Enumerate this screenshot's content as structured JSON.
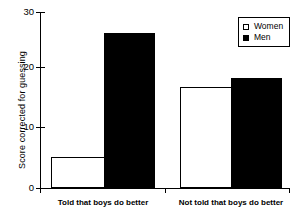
{
  "chart_data": {
    "type": "bar",
    "title": "",
    "xlabel": "",
    "ylabel": "Score corrected for guessing",
    "categories": [
      "Told that boys do better",
      "Not told that boys do better"
    ],
    "series": [
      {
        "name": "Women",
        "values": [
          5.3,
          17.3
        ],
        "color": "#ffffff",
        "edge": "#000000",
        "swatch": "open"
      },
      {
        "name": "Men",
        "values": [
          26.5,
          18.7
        ],
        "color": "#000000",
        "edge": "#000000",
        "swatch": "filled"
      }
    ],
    "ylim": [
      0,
      30
    ],
    "yticks": [
      0,
      10,
      20,
      30
    ],
    "ytick_labels": [
      "0",
      "10",
      "20",
      "30"
    ],
    "grid": false,
    "legend_position": "top-right",
    "legend_entries": [
      "Women",
      "Men"
    ]
  },
  "axis": {
    "y_label": "Score corrected for guessing",
    "tick_0": "0",
    "tick_10": "10",
    "tick_20": "20",
    "tick_30": "30"
  },
  "categories": {
    "group_1": "Told that boys do better",
    "group_2": "Not told that boys do better"
  },
  "legend": {
    "women": "Women",
    "men": "Men"
  },
  "colors": {
    "women_fill": "#ffffff",
    "men_fill": "#000000",
    "axis": "#000000",
    "background": "#ffffff"
  }
}
